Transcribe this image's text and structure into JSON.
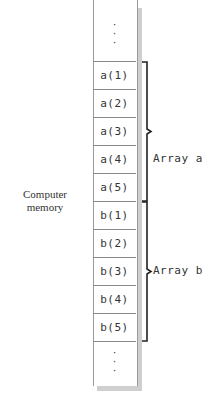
{
  "diagram": {
    "memory_label_line1": "Computer",
    "memory_label_line2": "memory",
    "top_dots": "·\n·\n·",
    "bottom_dots": "·\n·\n·",
    "cells": [
      "a(1)",
      "a(2)",
      "a(3)",
      "a(4)",
      "a(5)",
      "b(1)",
      "b(2)",
      "b(3)",
      "b(4)",
      "b(5)"
    ],
    "groups": [
      {
        "label": "Array a",
        "cells": [
          "a(1)",
          "a(2)",
          "a(3)",
          "a(4)",
          "a(5)"
        ]
      },
      {
        "label": "Array b",
        "cells": [
          "b(1)",
          "b(2)",
          "b(3)",
          "b(4)",
          "b(5)"
        ]
      }
    ]
  }
}
